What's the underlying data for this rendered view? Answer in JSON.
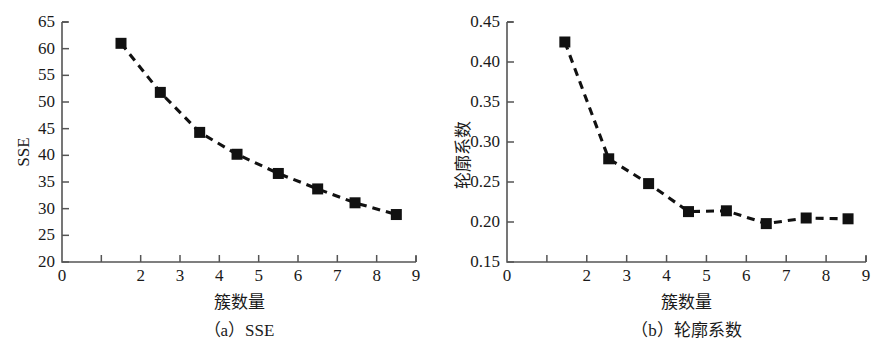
{
  "figure": {
    "panel_count": 2,
    "background_color": "#ffffff",
    "ink_color": "#1a1a1a",
    "axis_color": "#555555"
  },
  "chart_data": [
    {
      "type": "line",
      "panel_id": "a",
      "title": "",
      "caption": "（a）SSE",
      "xlabel": "簇数量",
      "ylabel": "SSE",
      "xlim": [
        0,
        9
      ],
      "ylim": [
        20,
        65
      ],
      "xticks": [
        0,
        1,
        2,
        3,
        4,
        5,
        6,
        7,
        8,
        9
      ],
      "xticklabels": [
        "0",
        "",
        "2",
        "3",
        "4",
        "5",
        "6",
        "7",
        "8",
        "9"
      ],
      "yticks": [
        20,
        25,
        30,
        35,
        40,
        45,
        50,
        55,
        60,
        65
      ],
      "yticklabels": [
        "20",
        "25",
        "30",
        "35",
        "40",
        "45",
        "50",
        "55",
        "60",
        "65"
      ],
      "grid": false,
      "legend": "none",
      "linestyle": "dashed",
      "marker": "square",
      "marker_color": "#111111",
      "line_color": "#111111",
      "x": [
        1.5,
        2.5,
        3.5,
        4.45,
        5.5,
        6.5,
        7.45,
        8.5
      ],
      "values": [
        61.0,
        51.8,
        44.3,
        40.2,
        36.6,
        33.7,
        31.1,
        28.9
      ]
    },
    {
      "type": "line",
      "panel_id": "b",
      "title": "",
      "caption": "（b）轮廓系数",
      "xlabel": "簇数量",
      "ylabel": "轮廓系数",
      "xlim": [
        0,
        9
      ],
      "ylim": [
        0.15,
        0.45
      ],
      "xticks": [
        0,
        1,
        2,
        3,
        4,
        5,
        6,
        7,
        8,
        9
      ],
      "xticklabels": [
        "0",
        "",
        "2",
        "3",
        "4",
        "5",
        "6",
        "7",
        "8",
        "9"
      ],
      "yticks": [
        0.15,
        0.2,
        0.25,
        0.3,
        0.35,
        0.4,
        0.45
      ],
      "yticklabels": [
        "0.15",
        "0.20",
        "0.25",
        "0.30",
        "0.35",
        "0.40",
        "0.45"
      ],
      "grid": false,
      "legend": "none",
      "linestyle": "dashed",
      "marker": "square",
      "marker_color": "#111111",
      "line_color": "#111111",
      "x": [
        1.45,
        2.55,
        3.55,
        4.55,
        5.5,
        6.5,
        7.5,
        8.55
      ],
      "values": [
        0.425,
        0.279,
        0.248,
        0.213,
        0.214,
        0.198,
        0.205,
        0.204
      ]
    }
  ]
}
